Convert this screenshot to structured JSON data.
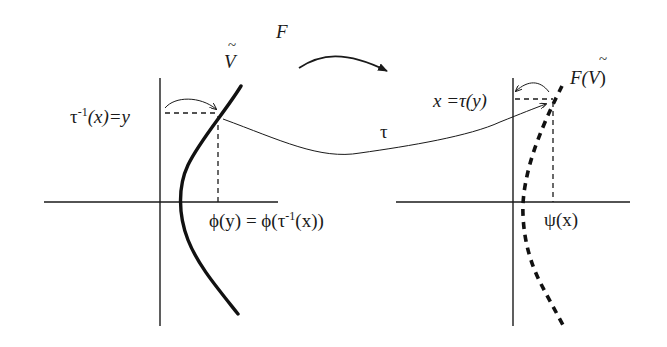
{
  "diagram": {
    "map_label": "F",
    "transfer_label": "τ",
    "left": {
      "curve_label": "V",
      "curve_label_accent": "~",
      "y_label_prefix": "τ",
      "y_label_sup": "-1",
      "y_label_suffix": "(x)=y",
      "x_label": "ϕ(y) = ϕ(τ",
      "x_label_sup": "-1",
      "x_label_suffix": "(x))"
    },
    "right": {
      "curve_label_prefix": "F(",
      "curve_label_var": "V",
      "curve_label_accent": "~",
      "curve_label_suffix": ")",
      "y_label": "x =τ(y)",
      "x_label": "ψ(x)"
    },
    "colors": {
      "ink": "#1a1a1a",
      "background": "#ffffff"
    }
  }
}
